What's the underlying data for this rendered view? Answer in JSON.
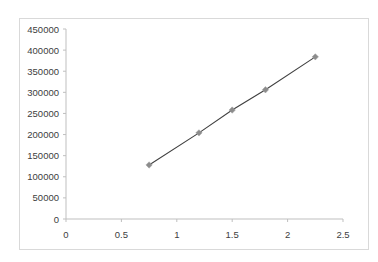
{
  "chart_data": {
    "type": "scatter",
    "title": "",
    "xlabel": "",
    "ylabel": "",
    "xlim": [
      0,
      2.5
    ],
    "ylim": [
      0,
      450000
    ],
    "x_ticks": [
      "0",
      "0.5",
      "1",
      "1.5",
      "2",
      "2.5"
    ],
    "y_ticks": [
      "0",
      "50000",
      "100000",
      "150000",
      "200000",
      "250000",
      "300000",
      "350000",
      "400000",
      "450000"
    ],
    "grid": false,
    "legend": null,
    "series": [
      {
        "name": "Series1",
        "marker": "diamond",
        "line": true,
        "x": [
          0.75,
          1.2,
          1.5,
          1.8,
          2.25
        ],
        "y": [
          128000,
          204000,
          258000,
          306000,
          384000
        ]
      }
    ]
  },
  "colors": {
    "axis": "#bfbfbf",
    "line": "#404040",
    "marker": "#8c8c8c",
    "frame": "#d9d9d9"
  }
}
